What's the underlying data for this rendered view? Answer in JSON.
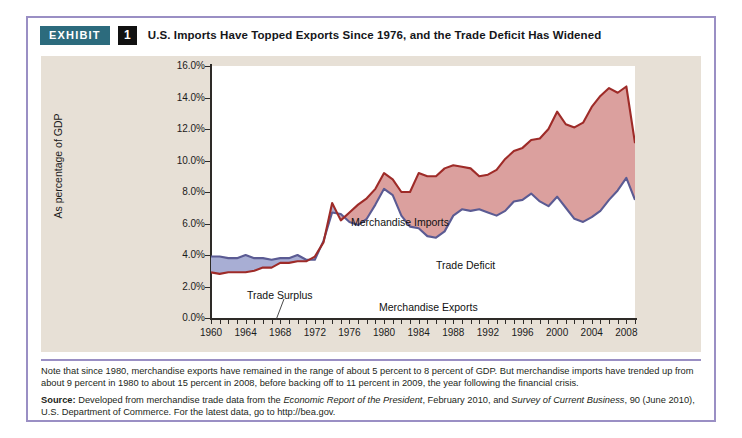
{
  "header": {
    "badge": "EXHIBIT",
    "number": "1",
    "title": "U.S. Imports Have Topped Exports Since 1976, and the Trade Deficit Has Widened"
  },
  "notes": {
    "note": "Note that since 1980, merchandise exports have remained in the range of about 5 percent to 8 percent of GDP. But merchandise imports have trended up from about 9 percent in 1980 to about 15 percent in 2008, before backing off to 11 percent in 2009, the year following the financial crisis.",
    "source_label": "Source:",
    "source_part1": " Developed from merchandise trade data from the ",
    "source_ital1": "Economic Report of the President",
    "source_part2": ", February 2010, and ",
    "source_ital2": "Survey of Current Business",
    "source_part3": ", 90 (June 2010), U.S. Department of Commerce. For the latest data, go to http://bea.gov."
  },
  "colors": {
    "badge_bg": "#2c6b7d",
    "number_bg": "#111111",
    "frame_border": "#9a8fc4",
    "panel_bg": "#e7e0d6",
    "imports_line": "#9e2b28",
    "exports_line": "#5b5b93",
    "deficit_fill": "#dba09e",
    "surplus_fill": "#a8aed4"
  },
  "chart_data": {
    "type": "area",
    "title": "U.S. Imports Have Topped Exports Since 1976, and the Trade Deficit Has Widened",
    "xlabel": "",
    "ylabel": "As percentage of GDP",
    "xlim": [
      1960,
      2009
    ],
    "ylim": [
      0,
      16
    ],
    "ytick_labels": [
      "0.0%",
      "2.0%",
      "4.0%",
      "6.0%",
      "8.0%",
      "10.0%",
      "12.0%",
      "14.0%",
      "16.0%"
    ],
    "ytick_values": [
      0,
      2,
      4,
      6,
      8,
      10,
      12,
      14,
      16
    ],
    "xtick_labels": [
      "1960",
      "1964",
      "1968",
      "1972",
      "1976",
      "1980",
      "1984",
      "1988",
      "1992",
      "1996",
      "2000",
      "2004",
      "2008"
    ],
    "xtick_values": [
      1960,
      1964,
      1968,
      1972,
      1976,
      1980,
      1984,
      1988,
      1992,
      1996,
      2000,
      2004,
      2008
    ],
    "grid": false,
    "legend_position": "inline-annotations",
    "annotations": [
      {
        "text": "Merchandise Imports",
        "x_px": 310,
        "y_px": 160
      },
      {
        "text": "Trade Deficit",
        "x_px": 395,
        "y_px": 203
      },
      {
        "text": "Trade Surplus",
        "x_px": 206,
        "y_px": 233
      },
      {
        "text": "Merchandise Exports",
        "x_px": 338,
        "y_px": 245
      }
    ],
    "x": [
      1960,
      1961,
      1962,
      1963,
      1964,
      1965,
      1966,
      1967,
      1968,
      1969,
      1970,
      1971,
      1972,
      1973,
      1974,
      1975,
      1976,
      1977,
      1978,
      1979,
      1980,
      1981,
      1982,
      1983,
      1984,
      1985,
      1986,
      1987,
      1988,
      1989,
      1990,
      1991,
      1992,
      1993,
      1994,
      1995,
      1996,
      1997,
      1998,
      1999,
      2000,
      2001,
      2002,
      2003,
      2004,
      2005,
      2006,
      2007,
      2008,
      2009
    ],
    "series": [
      {
        "name": "Merchandise Exports",
        "color": "#5b5b93",
        "values": [
          3.9,
          3.9,
          3.8,
          3.8,
          4.0,
          3.8,
          3.8,
          3.7,
          3.8,
          3.8,
          4.0,
          3.7,
          3.7,
          4.9,
          6.7,
          6.6,
          6.1,
          5.9,
          6.3,
          7.2,
          8.2,
          7.8,
          6.5,
          5.8,
          5.7,
          5.2,
          5.1,
          5.5,
          6.5,
          6.9,
          6.8,
          6.9,
          6.7,
          6.5,
          6.8,
          7.4,
          7.5,
          7.9,
          7.4,
          7.1,
          7.7,
          7.0,
          6.3,
          6.1,
          6.4,
          6.8,
          7.5,
          8.1,
          8.9,
          7.5
        ]
      },
      {
        "name": "Merchandise Imports",
        "color": "#9e2b28",
        "values": [
          2.9,
          2.8,
          2.9,
          2.9,
          2.9,
          3.0,
          3.2,
          3.2,
          3.5,
          3.5,
          3.6,
          3.6,
          3.9,
          4.8,
          7.3,
          6.2,
          6.7,
          7.2,
          7.6,
          8.2,
          9.2,
          8.8,
          8.0,
          8.0,
          9.2,
          9.0,
          9.0,
          9.5,
          9.7,
          9.6,
          9.5,
          9.0,
          9.1,
          9.4,
          10.1,
          10.6,
          10.8,
          11.3,
          11.4,
          12.0,
          13.1,
          12.3,
          12.1,
          12.4,
          13.4,
          14.1,
          14.6,
          14.3,
          14.7,
          11.1
        ]
      }
    ]
  }
}
